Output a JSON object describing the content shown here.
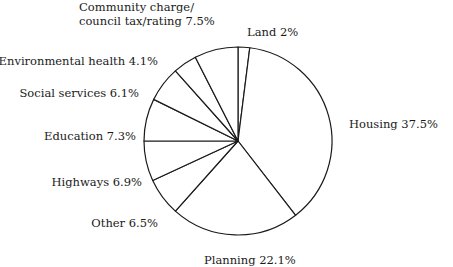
{
  "chart_data": {
    "type": "pie",
    "title": "",
    "start_angle_deg": 0,
    "direction": "clockwise",
    "categories": [
      "Land",
      "Housing",
      "Planning",
      "Other",
      "Highways",
      "Education",
      "Social services",
      "Environmental health",
      "Community charge/council tax/rating"
    ],
    "values": [
      2,
      37.5,
      22.1,
      6.5,
      6.9,
      7.3,
      6.1,
      4.1,
      7.5
    ],
    "unit": "%",
    "labels": [
      {
        "lines": [
          "Land 2%"
        ],
        "x": 247,
        "y": 36,
        "anchor": "start"
      },
      {
        "lines": [
          "Housing 37.5%"
        ],
        "x": 349,
        "y": 128,
        "anchor": "start"
      },
      {
        "lines": [
          "Planning 22.1%"
        ],
        "x": 204,
        "y": 264,
        "anchor": "start"
      },
      {
        "lines": [
          "Other 6.5%"
        ],
        "x": 158,
        "y": 227,
        "anchor": "end"
      },
      {
        "lines": [
          "Highways 6.9%"
        ],
        "x": 142,
        "y": 186,
        "anchor": "end"
      },
      {
        "lines": [
          "Education 7.3%"
        ],
        "x": 136,
        "y": 140,
        "anchor": "end"
      },
      {
        "lines": [
          "Social services 6.1%"
        ],
        "x": 139,
        "y": 97,
        "anchor": "end"
      },
      {
        "lines": [
          "Environmental health 4.1%"
        ],
        "x": 158,
        "y": 65,
        "anchor": "end"
      },
      {
        "lines": [
          "Community charge/",
          "council tax/rating 7.5%"
        ],
        "x": 79,
        "y": 25,
        "anchor": "start"
      }
    ],
    "geometry": {
      "cx": 238,
      "cy": 141,
      "r": 94
    },
    "colors": {
      "fill": "#ffffff",
      "stroke": "#1a1a1a"
    },
    "legend": "none",
    "grid": false
  }
}
